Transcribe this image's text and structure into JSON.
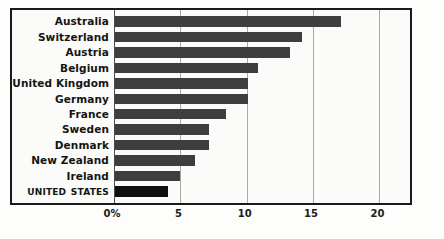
{
  "chart_data": {
    "type": "bar",
    "orientation": "horizontal",
    "title": "",
    "subtitle": "",
    "xlabel": "",
    "ylabel": "",
    "xlim": [
      0,
      22
    ],
    "grid": true,
    "legend": false,
    "tick_labels": [
      "0%",
      "5",
      "10",
      "15",
      "20"
    ],
    "tick_values": [
      0,
      5,
      10,
      15,
      20
    ],
    "categories": [
      "Australia",
      "Switzerland",
      "Austria",
      "Belgium",
      "United Kingdom",
      "Germany",
      "France",
      "Sweden",
      "Denmark",
      "New Zealand",
      "Ireland",
      "United States"
    ],
    "values": [
      17.0,
      14.1,
      13.2,
      10.8,
      10.0,
      10.0,
      8.4,
      7.1,
      7.1,
      6.0,
      4.9,
      4.0
    ],
    "highlight_category": "United States",
    "colors": {
      "bar": "#3e3e3e",
      "bar_highlight": "#100f0f",
      "frame": "#1a1a1a",
      "gridline": "#a9a9a5",
      "background": "#fbfbf9",
      "text": "#141414"
    }
  }
}
